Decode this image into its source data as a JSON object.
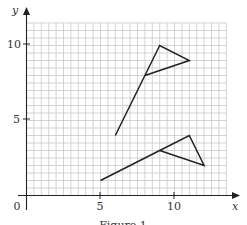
{
  "figure": {
    "caption": "Figure 1",
    "x_axis_label": "x",
    "y_axis_label": "y",
    "origin_label": "0",
    "x_tick_labels": [
      "5",
      "10"
    ],
    "y_tick_labels": [
      "5",
      "10"
    ]
  },
  "chart_data": {
    "type": "line",
    "title": "Figure 1",
    "xlabel": "x",
    "ylabel": "y",
    "xlim": [
      0,
      13.5
    ],
    "ylim": [
      0,
      11.5
    ],
    "grid": true,
    "x_ticks": [
      5,
      10
    ],
    "y_ticks": [
      5,
      10
    ],
    "series": [
      {
        "name": "upper-flag",
        "points": [
          [
            6,
            4
          ],
          [
            8,
            8
          ],
          [
            9,
            10
          ],
          [
            11,
            9
          ],
          [
            8,
            8
          ]
        ]
      },
      {
        "name": "lower-flag",
        "points": [
          [
            5,
            1
          ],
          [
            9,
            3
          ],
          [
            11,
            4
          ],
          [
            12,
            2
          ],
          [
            9,
            3
          ]
        ]
      }
    ]
  }
}
